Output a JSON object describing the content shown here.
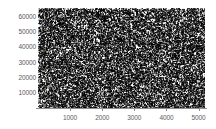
{
  "chart_data": {
    "type": "scatter",
    "title": "",
    "subtitle": "",
    "xlabel": "",
    "ylabel": "",
    "xlim": [
      0,
      5200
    ],
    "ylim": [
      0,
      65500
    ],
    "xticks": [
      1000,
      2000,
      3000,
      4000,
      5000
    ],
    "yticks": [
      10000,
      20000,
      30000,
      40000,
      50000,
      60000
    ],
    "xtick_labels": [
      "1000",
      "2000",
      "3000",
      "4000",
      "5000"
    ],
    "ytick_labels": [
      "10000",
      "20000",
      "30000",
      "40000",
      "50000",
      "60000"
    ],
    "grid": false,
    "legend": null,
    "legend_position": "none",
    "annotations": [],
    "series": [
      {
        "name": "points",
        "marker": "pixel",
        "color": "#000000",
        "point_count": 20000,
        "description": "uniformly distributed random points filling the full axes region",
        "x_range": [
          0,
          5200
        ],
        "y_range": [
          0,
          65500
        ]
      }
    ]
  },
  "figure": {
    "background_color": "#ffffff",
    "point_color": "#000000",
    "axis_color": "#8e8e8e",
    "tick_label_color": "#5a5a5a",
    "plot_left_px": 38,
    "plot_top_px": 8,
    "plot_width_px": 167,
    "plot_height_px": 100
  }
}
